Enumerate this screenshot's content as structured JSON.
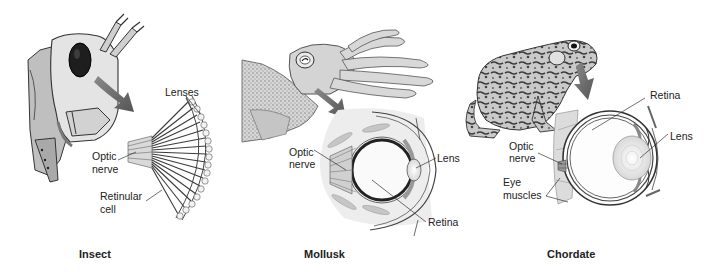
{
  "panels": [
    {
      "id": "insect",
      "caption": "Insect",
      "labels": {
        "lenses": "Lenses",
        "optic_nerve_1": "Optic",
        "optic_nerve_2": "nerve",
        "retinular_1": "Retinular",
        "retinular_2": "cell"
      }
    },
    {
      "id": "mollusk",
      "caption": "Mollusk",
      "labels": {
        "optic_nerve_1": "Optic",
        "optic_nerve_2": "nerve",
        "lens": "Lens",
        "retina": "Retina"
      }
    },
    {
      "id": "chordate",
      "caption": "Chordate",
      "labels": {
        "retina": "Retina",
        "lens": "Lens",
        "optic_nerve_1": "Optic",
        "optic_nerve_2": "nerve",
        "eye_muscles_1": "Eye",
        "eye_muscles_2": "muscles"
      }
    }
  ],
  "colors": {
    "background": "#ffffff",
    "ink": "#222222",
    "arrow": "#666666",
    "fill_light": "#e6e6e6",
    "fill_mid": "#bdbdbd",
    "fill_dark": "#4a4a4a"
  }
}
